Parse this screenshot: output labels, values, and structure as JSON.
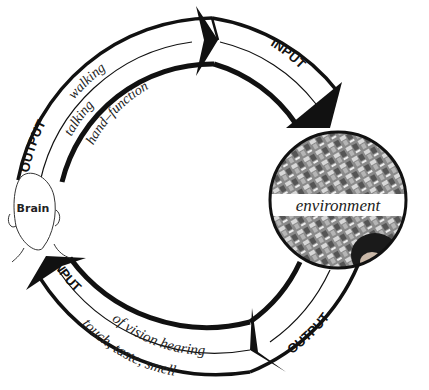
{
  "diagram": {
    "brain": {
      "label": "Brain"
    },
    "environment": {
      "label": "environment"
    },
    "top_left_arrow": {
      "label": "OUTPUT",
      "items": [
        "walking",
        "talking",
        "hand–function"
      ]
    },
    "top_right_arrow": {
      "label": "INPUT"
    },
    "bottom_right_arrow": {
      "label": "OUTPUT"
    },
    "bottom_left_arrow": {
      "label": "INPUT",
      "line1": "of vision hearing",
      "line2": "touch, taste, smell"
    },
    "colors": {
      "stroke": "#111111",
      "background": "#ffffff"
    }
  }
}
